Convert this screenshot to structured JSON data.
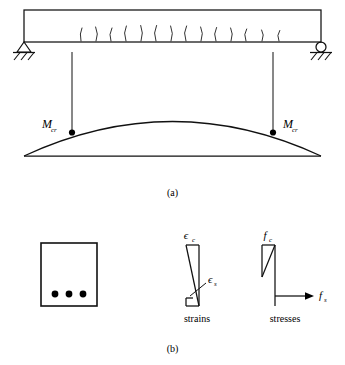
{
  "figure": {
    "panels": [
      {
        "id": "a",
        "caption": "(a)"
      },
      {
        "id": "b",
        "caption": "(b)"
      }
    ]
  },
  "panel_a": {
    "caption": "(a)",
    "beam": {
      "name": "simply-supported-beam",
      "left_support_type": "pin",
      "right_support_type": "roller",
      "crack_count": 14,
      "crack_label": "flexural-cracks"
    },
    "moment_diagram": {
      "shape": "parabola",
      "baseline_label": "",
      "markers": [
        {
          "label": "M",
          "subscript": "cr",
          "position": "left"
        },
        {
          "label": "M",
          "subscript": "cr",
          "position": "right"
        }
      ]
    }
  },
  "panel_b": {
    "caption": "(b)",
    "section": {
      "name": "beam-cross-section",
      "rebar_count": 3
    },
    "strains": {
      "caption": "strains",
      "top_label": "ϵ",
      "top_subscript": "c",
      "bottom_label": "ϵ",
      "bottom_subscript": "s"
    },
    "stresses": {
      "caption": "stresses",
      "top_label": "f",
      "top_subscript": "c",
      "bottom_label": "f",
      "bottom_subscript": "s"
    }
  },
  "colors": {
    "ink": "#111111",
    "background": "#ffffff",
    "rebar": "#000000"
  }
}
